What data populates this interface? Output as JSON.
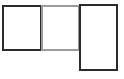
{
  "canvas": {
    "width": 124,
    "height": 79,
    "background_color": "#ffffff",
    "description": "Three empty rectangular pane outlines arranged left to right"
  },
  "panes": [
    {
      "name": "left-pane",
      "label": "",
      "border_color": "#2b2b2b",
      "fill_color": "#ffffff",
      "x": 2,
      "y": 5,
      "width": 40,
      "height": 46,
      "border_width": 2
    },
    {
      "name": "middle-pane",
      "label": "",
      "border_color": "#9b9b9b",
      "fill_color": "#ffffff",
      "x": 41,
      "y": 5,
      "width": 39,
      "height": 46,
      "border_width": 2
    },
    {
      "name": "right-pane",
      "label": "",
      "border_color": "#2b2b2b",
      "fill_color": "#ffffff",
      "x": 79,
      "y": 4,
      "width": 39,
      "height": 67,
      "border_width": 2
    }
  ]
}
